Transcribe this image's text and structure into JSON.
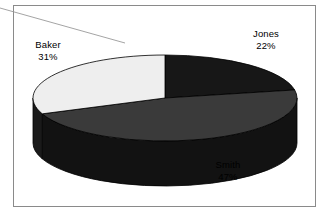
{
  "frame": {
    "border_color": "#8a8a8a",
    "background": "#ffffff"
  },
  "artifacts": {
    "leader_line_color": "#9a9a9a"
  },
  "chart_data": {
    "type": "pie",
    "title": "",
    "subtitle": "",
    "xlabel": "",
    "ylabel": "",
    "legend_position": "none",
    "three_d": true,
    "categories": [
      "Jones",
      "Smith",
      "Baker"
    ],
    "values": [
      22,
      47,
      31
    ],
    "unit": "%",
    "labels": [
      {
        "name": "Jones",
        "value": 22,
        "value_text": "22%",
        "color": "#171717",
        "side_color": "#0e0e0e"
      },
      {
        "name": "Smith",
        "value": 47,
        "value_text": "47%",
        "color": "#3a3a3a",
        "side_color": "#121212"
      },
      {
        "name": "Baker",
        "value": 31,
        "value_text": "31%",
        "color": "#eeeeee",
        "side_color": "#1a1a1a"
      }
    ],
    "total": 100,
    "start_angle_deg": 0,
    "direction": "clockwise",
    "outline_color": "#000000"
  }
}
